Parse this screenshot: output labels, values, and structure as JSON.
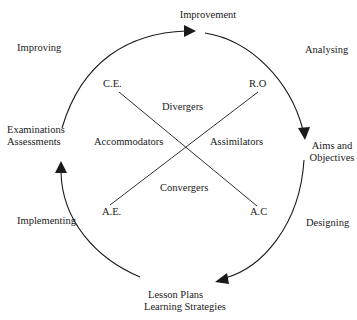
{
  "cycle": {
    "stages": [
      {
        "id": "improvement",
        "label": "Improvement"
      },
      {
        "id": "aims",
        "line1": "Aims and",
        "line2": "Objectives"
      },
      {
        "id": "lesson",
        "line1": "Lesson Plans",
        "line2": "Learning Strategies"
      },
      {
        "id": "exams",
        "line1": "Examinations",
        "line2": "Assessments"
      }
    ],
    "phases": {
      "analysing": "Analysing",
      "designing": "Designing",
      "implementing": "Implementing",
      "improving": "Improving"
    }
  },
  "axes": {
    "ce": "C.E.",
    "ro": "R.O",
    "ae": "A.E.",
    "ac": "A.C"
  },
  "styles": {
    "top": "Divergers",
    "left": "Accommodators",
    "right": "Assimilators",
    "bottom": "Convergers"
  },
  "colors": {
    "stroke": "#1a1a1a",
    "background": "#ffffff"
  }
}
